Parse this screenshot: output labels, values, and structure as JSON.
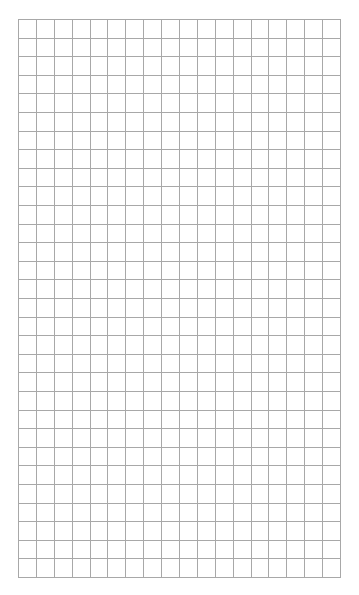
{
  "page": {
    "type": "graph-paper",
    "background_color": "#ffffff"
  },
  "grid": {
    "columns": 18,
    "rows": 30,
    "line_color": "#a8a8a8",
    "left": 18,
    "top": 19,
    "width": 323,
    "height": 559
  }
}
